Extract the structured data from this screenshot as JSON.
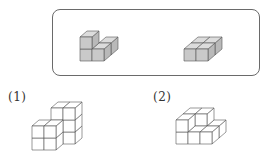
{
  "reference_box": {
    "caption": "",
    "pieces": [
      {
        "name": "l-shaped-piece",
        "description": "L-shaped piece made of 4 shaded cubes: 2-cube vertical column on the left, plus 2 cubes extending to the back-right at the bottom level",
        "fill": "#cfcfcf",
        "cubes": [
          [
            0,
            0,
            0
          ],
          [
            0,
            0,
            1
          ],
          [
            1,
            1,
            0
          ],
          [
            1,
            0,
            0
          ]
        ]
      },
      {
        "name": "flat-square-piece",
        "description": "Flat 2x2 square piece of 4 shaded cubes, one layer high",
        "fill": "#cfcfcf",
        "cubes": [
          [
            0,
            0,
            0
          ],
          [
            1,
            0,
            0
          ],
          [
            0,
            1,
            0
          ],
          [
            1,
            1,
            0
          ]
        ]
      }
    ]
  },
  "problems": [
    {
      "label": "(1)",
      "description": "Solid of unshaded cubes: front-left 2-high column, back 2-wide by 3-high wall",
      "cubes": [
        [
          0,
          0,
          0
        ],
        [
          0,
          0,
          1
        ],
        [
          1,
          1,
          0
        ],
        [
          1,
          1,
          1
        ],
        [
          1,
          1,
          2
        ],
        [
          2,
          1,
          0
        ],
        [
          2,
          1,
          1
        ],
        [
          2,
          1,
          2
        ],
        [
          1,
          0,
          0
        ],
        [
          1,
          0,
          1
        ]
      ]
    },
    {
      "label": "(2)",
      "description": "Solid of unshaded cubes forming a staircase: back-left 2x2 block 2 high, front and right cubes 1 high",
      "cubes": [
        [
          0,
          1,
          0
        ],
        [
          0,
          1,
          1
        ],
        [
          1,
          1,
          0
        ],
        [
          1,
          1,
          1
        ],
        [
          0,
          0,
          0
        ],
        [
          0,
          0,
          1
        ],
        [
          1,
          0,
          0
        ],
        [
          2,
          1,
          0
        ],
        [
          2,
          0,
          0
        ]
      ]
    }
  ],
  "colors": {
    "shaded_front": "#c9c9c9",
    "shaded_side": "#b9b9b9",
    "shaded_top": "#dcdcdc",
    "edge": "#555555",
    "box_border": "#6a6a6a",
    "unshaded": "#ffffff"
  }
}
